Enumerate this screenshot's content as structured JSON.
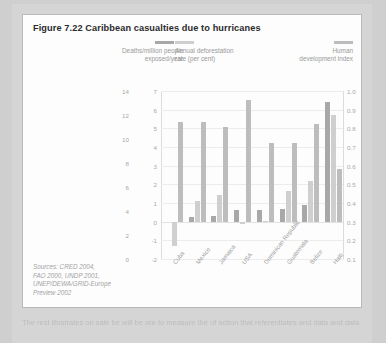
{
  "figure": {
    "title": "Figure 7.22 Caribbean casualties due to hurricanes",
    "sources": [
      "Sources: CRED 2004,",
      "FAO 2000, UNDP 2001,",
      "UNEP/DEWA/GRID-Europe",
      "Preview 2002"
    ],
    "body_text": "The rest illustrates on sale be will be are to measure the of action that referentiates and data and data"
  },
  "colors": {
    "deaths": "#a8a8a8",
    "deforestation": "#cfcfcf",
    "hdi": "#bdbdbd",
    "page_background": "#cfcfcf",
    "figure_background": "#fdfdfd",
    "axis_text": "#a8a8a8"
  },
  "chart_data": {
    "type": "bar",
    "title": "Figure 7.22 Caribbean casualties due to hurricanes",
    "xlabel": "",
    "categories": [
      "Cuba",
      "Mexico",
      "Jamaica",
      "USA",
      "Dominican Republic",
      "Guatemala",
      "Belize",
      "Haiti"
    ],
    "grid": true,
    "legend_position": "top",
    "series": [
      {
        "name": "Deaths/million people exposed/year",
        "axis": "left",
        "ylabel": "Deaths/million people exposed/year",
        "ylim": [
          0,
          14
        ],
        "yticks": [
          "14",
          "12",
          "10",
          "8",
          "6",
          "4",
          "2",
          "0"
        ],
        "values": [
          0,
          0.55,
          0.65,
          1.2,
          1.3,
          1.4,
          1.8,
          12.8
        ]
      },
      {
        "name": "Annual deforestation rate (per cent)",
        "axis": "mid",
        "ylabel": "Annual deforestation rate (per cent)",
        "ylim": [
          -2,
          7
        ],
        "yticks": [
          "7",
          "6",
          "5",
          "4",
          "3",
          "2",
          "1",
          "0",
          "-1",
          "-2"
        ],
        "values": [
          -1.3,
          1.1,
          1.45,
          -0.15,
          0,
          1.65,
          2.2,
          5.7
        ]
      },
      {
        "name": "Human development index",
        "axis": "right",
        "ylabel": "Human development index",
        "ylim": [
          0.1,
          1.0
        ],
        "yticks": [
          "1.0",
          "0.9",
          "0.8",
          "0.7",
          "0.6",
          "0.5",
          "0.4",
          "0.3",
          "0.2",
          "0.1"
        ],
        "values": [
          0.79,
          0.79,
          0.755,
          0.935,
          0.64,
          0.64,
          0.77,
          0.465
        ]
      }
    ]
  },
  "legend": [
    {
      "label_line1": "Deaths/million people",
      "label_line2": "exposed/year"
    },
    {
      "label_line1": "Annual deforestation",
      "label_line2": "rate (per cent)"
    },
    {
      "label_line1": "Human",
      "label_line2": "development index"
    }
  ]
}
